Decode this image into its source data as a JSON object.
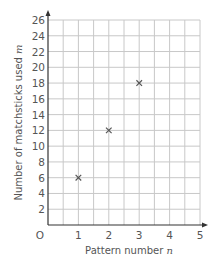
{
  "chart_data": {
    "type": "scatter",
    "title": "",
    "xlabel": "Pattern number",
    "xlabel_var": "n",
    "ylabel": "Number of matchsticks used",
    "ylabel_var": "m",
    "origin_label": "O",
    "xlim": [
      0,
      5
    ],
    "ylim": [
      0,
      26
    ],
    "x_ticks": [
      1,
      2,
      3,
      4,
      5
    ],
    "y_ticks": [
      2,
      4,
      6,
      8,
      10,
      12,
      14,
      16,
      18,
      20,
      22,
      24,
      26
    ],
    "grid": true,
    "grid_minor_x": 0.5,
    "grid_minor_y": 2,
    "marker": "x",
    "points": [
      {
        "x": 1,
        "y": 6
      },
      {
        "x": 2,
        "y": 12
      },
      {
        "x": 3,
        "y": 18
      }
    ],
    "colors": {
      "grid": "#c8c8c8",
      "axis": "#333333",
      "marker": "#555555",
      "text": "#555555"
    }
  }
}
